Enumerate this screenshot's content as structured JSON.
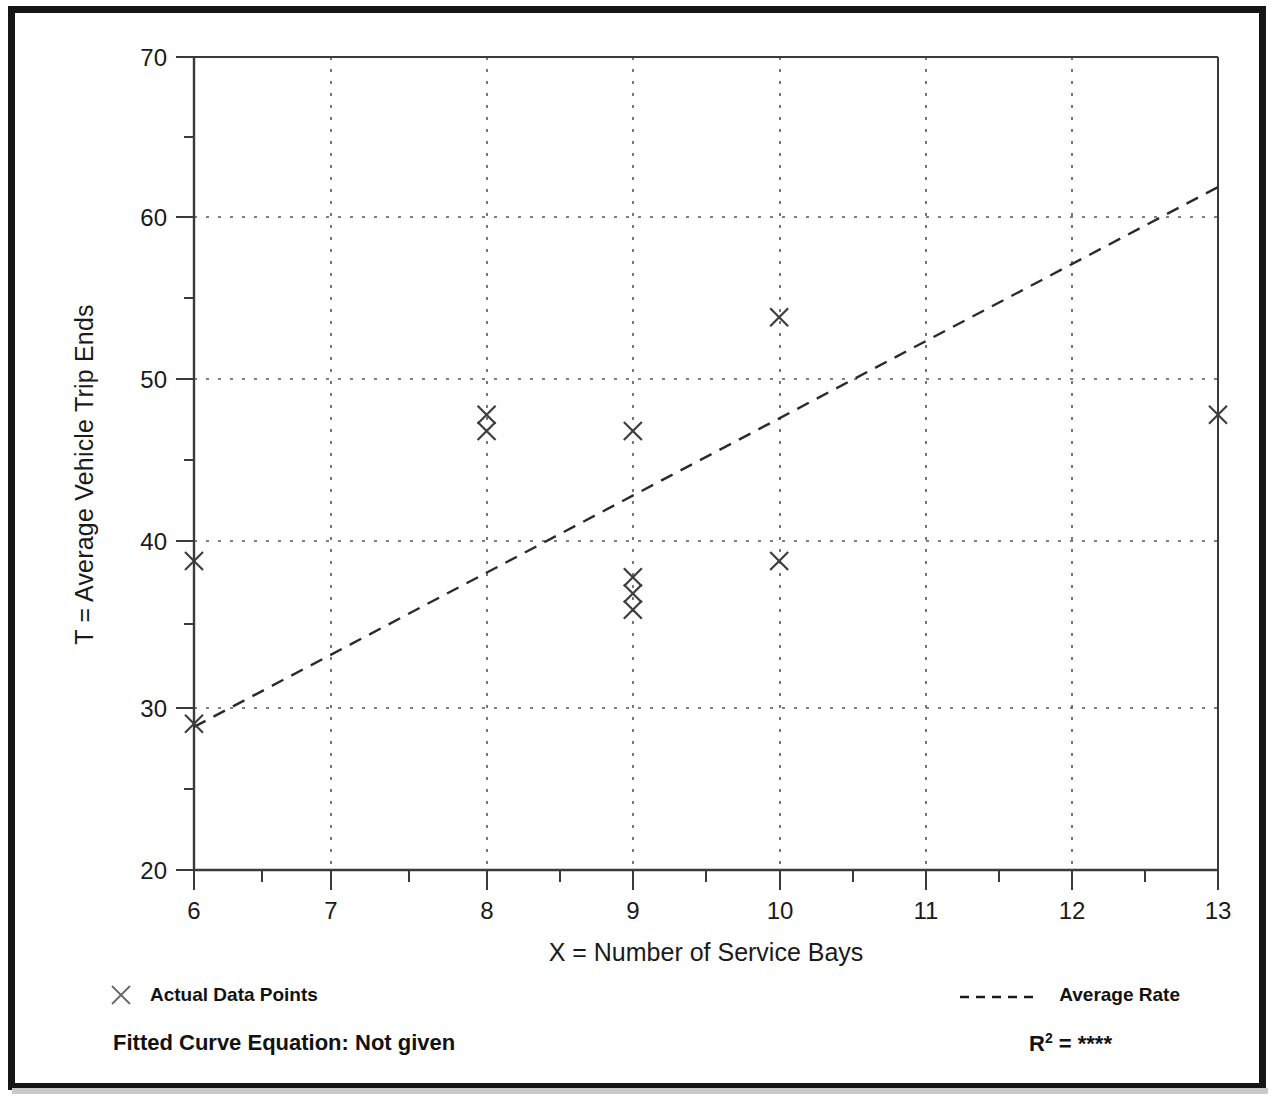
{
  "figure": {
    "frame_color": "#151515",
    "background": "#ffffff"
  },
  "axes": {
    "xlabel": "X = Number of Service Bays",
    "ylabel": "T = Average Vehicle Trip Ends",
    "x_ticks": [
      "6",
      "7",
      "8",
      "9",
      "10",
      "11",
      "12",
      "13"
    ],
    "y_ticks": [
      "20",
      "30",
      "40",
      "50",
      "60",
      "70"
    ]
  },
  "legend": {
    "points_label": "Actual Data Points",
    "line_label": "Average Rate",
    "point_marker": "x-marker-icon",
    "line_marker": "dashed-line-icon"
  },
  "footer": {
    "fitted_equation": "Fitted Curve Equation:  Not given",
    "r2_symbol": "R",
    "r2_exponent": "2",
    "r2_equals": " = ",
    "r2_value": "****"
  },
  "chart_data": {
    "type": "scatter",
    "title": "",
    "xlabel": "X = Number of Service Bays",
    "ylabel": "T = Average Vehicle Trip Ends",
    "xlim": [
      6,
      13
    ],
    "ylim": [
      20,
      70
    ],
    "x_major_ticks": [
      6,
      7,
      8,
      9,
      10,
      11,
      12,
      13
    ],
    "y_major_ticks": [
      20,
      30,
      40,
      50,
      60,
      70
    ],
    "x_minor_step": 0.5,
    "y_minor_step": 5,
    "grid": true,
    "grid_style": "dotted",
    "legend_position": "below-axes",
    "series": [
      {
        "name": "Actual Data Points",
        "type": "scatter",
        "marker": "x",
        "points": [
          {
            "x": 6,
            "y": 39
          },
          {
            "x": 6,
            "y": 29
          },
          {
            "x": 8,
            "y": 48
          },
          {
            "x": 8,
            "y": 47
          },
          {
            "x": 9,
            "y": 47
          },
          {
            "x": 9,
            "y": 38
          },
          {
            "x": 9,
            "y": 37
          },
          {
            "x": 9,
            "y": 36
          },
          {
            "x": 10,
            "y": 54
          },
          {
            "x": 10,
            "y": 39
          },
          {
            "x": 13,
            "y": 48
          }
        ]
      },
      {
        "name": "Average Rate",
        "type": "line",
        "style": "dashed",
        "points": [
          {
            "x": 6,
            "y": 28.8
          },
          {
            "x": 13,
            "y": 62.0
          }
        ]
      }
    ],
    "annotations": [
      "Fitted Curve Equation:  Not given",
      "R2 = ****"
    ]
  }
}
